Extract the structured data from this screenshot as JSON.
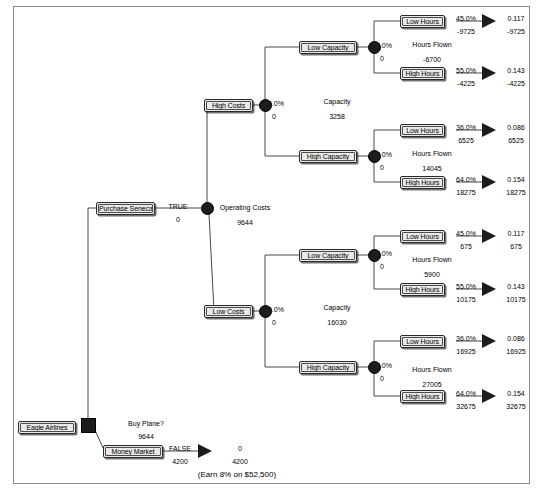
{
  "diagram": {
    "root_label": "Eagle Airlines",
    "decision_question": "Buy Plane?",
    "decision_value": "9644",
    "footnote": "(Earn 8% on $52,500)",
    "colors": {
      "node_fill": "#1c1c1c",
      "box_fill": "#e9e9e9",
      "border": "#2b2b2b",
      "frame": "#8a8a8a",
      "background": "#ffffff"
    }
  },
  "branches": {
    "purchase": {
      "label": "Purchase Seneca",
      "flag": "TRUE",
      "value": "0",
      "node_title": "Operating Costs",
      "node_value": "9644"
    },
    "money_market": {
      "label": "Money Market",
      "flag": "FALSE",
      "value": "4200",
      "payoff_prob": "0",
      "payoff_value": "4200"
    }
  },
  "cost_branches": [
    {
      "label": "High Costs",
      "prob": "50.0%",
      "value": "0",
      "node_title": "Capacity",
      "node_value": "3258"
    },
    {
      "label": "Low Costs",
      "prob": "50.0%",
      "value": "0",
      "node_title": "Capacity",
      "node_value": "16030"
    }
  ],
  "capacity_branches": [
    {
      "label": "Low Capacity",
      "prob": "52.0%",
      "value": "0",
      "node_title": "Hours Flown",
      "node_value": "-6700"
    },
    {
      "label": "High Capacity",
      "prob": "48.0%",
      "value": "0",
      "node_title": "Hours Flown",
      "node_value": "14045"
    },
    {
      "label": "Low Capacity",
      "prob": "52.0%",
      "value": "0",
      "node_title": "Hours Flown",
      "node_value": "5900"
    },
    {
      "label": "High Capacity",
      "prob": "48.0%",
      "value": "0",
      "node_title": "Hours Flown",
      "node_value": "27005"
    }
  ],
  "hours_branches": [
    {
      "label": "Low Hours",
      "prob": "45.0%",
      "value": "-9725",
      "payoff_prob": "0.117",
      "payoff_value": "-9725"
    },
    {
      "label": "High Hours",
      "prob": "55.0%",
      "value": "-4225",
      "payoff_prob": "0.143",
      "payoff_value": "-4225"
    },
    {
      "label": "Low Hours",
      "prob": "36.0%",
      "value": "6525",
      "payoff_prob": "0.086",
      "payoff_value": "6525"
    },
    {
      "label": "High Hours",
      "prob": "64.0%",
      "value": "18275",
      "payoff_prob": "0.154",
      "payoff_value": "18275"
    },
    {
      "label": "Low Hours",
      "prob": "45.0%",
      "value": "675",
      "payoff_prob": "0.117",
      "payoff_value": "675"
    },
    {
      "label": "High Hours",
      "prob": "55.0%",
      "value": "10175",
      "payoff_prob": "0.143",
      "payoff_value": "10175"
    },
    {
      "label": "Low Hours",
      "prob": "36.0%",
      "value": "16925",
      "payoff_prob": "0.086",
      "payoff_value": "16925"
    },
    {
      "label": "High Hours",
      "prob": "64.0%",
      "value": "32675",
      "payoff_prob": "0.154",
      "payoff_value": "32675"
    }
  ]
}
